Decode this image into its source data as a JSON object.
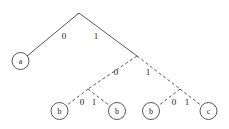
{
  "diagram": {
    "type": "binary-decision-tree",
    "background_color": "#ffffff",
    "line_color": "#595959",
    "text_color": "#1a1a1a",
    "width": 229,
    "height": 129,
    "root": {
      "id": "root",
      "x": 79,
      "y": 13,
      "shape": "apex",
      "label": ""
    },
    "junctions": [
      {
        "id": "j1",
        "x": 137,
        "y": 56,
        "label": ""
      },
      {
        "id": "j2",
        "x": 88,
        "y": 89,
        "label": ""
      },
      {
        "id": "j3",
        "x": 180,
        "y": 89,
        "label": ""
      }
    ],
    "nodes": [
      {
        "id": "n-a",
        "label": "a",
        "x": 20.5,
        "y": 61,
        "r": 8.5
      },
      {
        "id": "n-b1",
        "label": "b",
        "x": 59.5,
        "y": 111,
        "r": 8.5
      },
      {
        "id": "n-b2",
        "label": "b",
        "x": 117,
        "y": 111,
        "r": 8.5
      },
      {
        "id": "n-b3",
        "label": "b",
        "x": 151,
        "y": 111,
        "r": 8.5
      },
      {
        "id": "n-c",
        "label": "c",
        "x": 208.5,
        "y": 111,
        "r": 8.5
      }
    ],
    "edges": [
      {
        "id": "e-root-a",
        "from": "root",
        "to": "n-a",
        "style": "solid",
        "x1": 79,
        "y1": 13,
        "x2": 27,
        "y2": 56
      },
      {
        "id": "e-root-j1",
        "from": "root",
        "to": "j1",
        "style": "solid",
        "x1": 79,
        "y1": 13,
        "x2": 137,
        "y2": 56
      },
      {
        "id": "e-j1-j2",
        "from": "j1",
        "to": "j2",
        "style": "dashed",
        "x1": 137,
        "y1": 56,
        "x2": 88,
        "y2": 89
      },
      {
        "id": "e-j1-j3",
        "from": "j1",
        "to": "j3",
        "style": "dashed",
        "x1": 137,
        "y1": 56,
        "x2": 180,
        "y2": 89
      },
      {
        "id": "e-j2-b1",
        "from": "j2",
        "to": "n-b1",
        "style": "dashed",
        "x1": 88,
        "y1": 89,
        "x2": 66,
        "y2": 106
      },
      {
        "id": "e-j2-b2",
        "from": "j2",
        "to": "n-b2",
        "style": "dashed",
        "x1": 88,
        "y1": 89,
        "x2": 110,
        "y2": 106
      },
      {
        "id": "e-j3-b3",
        "from": "j3",
        "to": "n-b3",
        "style": "dashed",
        "x1": 180,
        "y1": 89,
        "x2": 158,
        "y2": 106
      },
      {
        "id": "e-j3-c",
        "from": "j3",
        "to": "n-c",
        "style": "dashed",
        "x1": 180,
        "y1": 89,
        "x2": 202,
        "y2": 106
      }
    ],
    "edge_labels": [
      {
        "id": "lbl-root-left",
        "text": "0",
        "x": 64,
        "y": 36
      },
      {
        "id": "lbl-root-right",
        "text": "1",
        "x": 96,
        "y": 36
      },
      {
        "id": "lbl-j1-left",
        "text": "0",
        "x": 116,
        "y": 72
      },
      {
        "id": "lbl-j1-right",
        "text": "1",
        "x": 148,
        "y": 72
      },
      {
        "id": "lbl-j2-left",
        "text": "0",
        "x": 82,
        "y": 102
      },
      {
        "id": "lbl-j2-right",
        "text": "1",
        "x": 94,
        "y": 102
      },
      {
        "id": "lbl-j3-left",
        "text": "0",
        "x": 174,
        "y": 102
      },
      {
        "id": "lbl-j3-right",
        "text": "1",
        "x": 187,
        "y": 102
      }
    ]
  }
}
